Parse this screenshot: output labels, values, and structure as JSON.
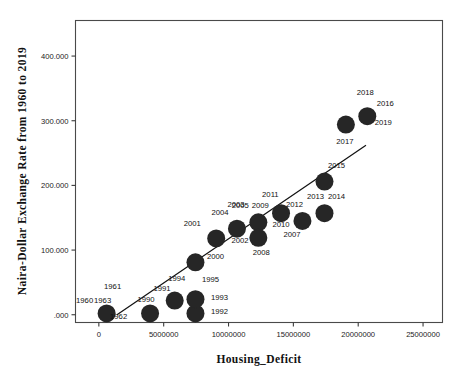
{
  "chart_data": {
    "type": "scatter",
    "title": "",
    "xlabel": "Housing_Deficit",
    "ylabel": "Naira-Dollar Exchange Rate from 1960 to 2019",
    "xlim": [
      -1800000,
      26500000
    ],
    "ylim": [
      -12,
      455
    ],
    "grid": false,
    "legend": null,
    "xticks": [
      0,
      5000000,
      10000000,
      15000000,
      20000000,
      25000000
    ],
    "xtick_labels": [
      "0",
      "5000000",
      "10000000",
      "15000000",
      "20000000",
      "25000000"
    ],
    "yticks": [
      0,
      100,
      200,
      300,
      400
    ],
    "ytick_labels": [
      ".000",
      "100.000",
      "200.000",
      "300.000",
      "400.000"
    ],
    "fit_line": {
      "present": true,
      "x_start": 1400000,
      "y_start": 0,
      "x_end": 20600000,
      "y_end": 262
    },
    "point_labels_field": "year",
    "points": [
      {
        "year": "1960",
        "x": 600000,
        "y": 2,
        "label_dx": -22,
        "label_dy": -10
      },
      {
        "year": "1961",
        "x": 600000,
        "y": 2,
        "label_dx": 6,
        "label_dy": -24
      },
      {
        "year": "1962",
        "x": 600000,
        "y": 2,
        "label_dx": 12,
        "label_dy": 6
      },
      {
        "year": "1963",
        "x": 600000,
        "y": 2,
        "label_dx": -4,
        "label_dy": -10
      },
      {
        "year": "1990",
        "x": 3950000,
        "y": 2,
        "label_dx": -4,
        "label_dy": -11
      },
      {
        "year": "1991",
        "x": 3950000,
        "y": 2,
        "label_dx": 12,
        "label_dy": -22
      },
      {
        "year": "1994",
        "x": 5850000,
        "y": 22,
        "label_dx": 2,
        "label_dy": -20
      },
      {
        "year": "1992",
        "x": 7450000,
        "y": 2,
        "label_dx": 24,
        "label_dy": 1
      },
      {
        "year": "1993",
        "x": 7450000,
        "y": 24,
        "label_dx": 24,
        "label_dy": 1
      },
      {
        "year": "1995",
        "x": 7450000,
        "y": 24,
        "label_dx": 15,
        "label_dy": -17
      },
      {
        "year": "2000",
        "x": 7450000,
        "y": 81,
        "label_dx": 20,
        "label_dy": -3
      },
      {
        "year": "2001",
        "x": 9050000,
        "y": 118,
        "label_dx": -24,
        "label_dy": -12
      },
      {
        "year": "2002",
        "x": 10650000,
        "y": 133,
        "label_dx": 3,
        "label_dy": 14
      },
      {
        "year": "2004",
        "x": 10650000,
        "y": 133,
        "label_dx": -17,
        "label_dy": -14
      },
      {
        "year": "2003",
        "x": 10650000,
        "y": 133,
        "label_dx": -1,
        "label_dy": -22
      },
      {
        "year": "2005",
        "x": 12300000,
        "y": 143,
        "label_dx": -18,
        "label_dy": -14
      },
      {
        "year": "2009",
        "x": 12300000,
        "y": 143,
        "label_dx": 2,
        "label_dy": -14
      },
      {
        "year": "2011",
        "x": 12300000,
        "y": 143,
        "label_dx": 12,
        "label_dy": -25
      },
      {
        "year": "2008",
        "x": 12300000,
        "y": 119,
        "label_dx": 3,
        "label_dy": 17
      },
      {
        "year": "2010",
        "x": 14050000,
        "y": 157,
        "label_dx": 0,
        "label_dy": 14
      },
      {
        "year": "2007",
        "x": 14050000,
        "y": 157,
        "label_dx": 11,
        "label_dy": 24
      },
      {
        "year": "2012",
        "x": 15700000,
        "y": 145,
        "label_dx": -8,
        "label_dy": -14
      },
      {
        "year": "2013",
        "x": 17400000,
        "y": 157,
        "label_dx": -9,
        "label_dy": -14
      },
      {
        "year": "2014",
        "x": 17400000,
        "y": 157,
        "label_dx": 12,
        "label_dy": -14
      },
      {
        "year": "2015",
        "x": 17400000,
        "y": 206,
        "label_dx": 12,
        "label_dy": -14
      },
      {
        "year": "2017",
        "x": 19050000,
        "y": 294,
        "label_dx": -1,
        "label_dy": 19
      },
      {
        "year": "2018",
        "x": 20700000,
        "y": 307,
        "label_dx": -2,
        "label_dy": -21
      },
      {
        "year": "2016",
        "x": 20700000,
        "y": 307,
        "label_dx": 18,
        "label_dy": -10
      },
      {
        "year": "2019",
        "x": 20700000,
        "y": 307,
        "label_dx": 16,
        "label_dy": 9
      }
    ]
  },
  "axes": {
    "x_title": "Housing_Deficit",
    "y_title": "Naira-Dollar Exchange Rate from 1960 to 2019"
  },
  "style": {
    "marker_color": "#262626",
    "line_color": "#111111",
    "frame_color": "#4a4a4a",
    "background": "#ffffff"
  }
}
